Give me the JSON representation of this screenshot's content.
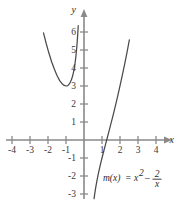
{
  "figure": {
    "kind": "cartesian-graph",
    "background_color": "#ffffff",
    "axis_color": "#8a8a8a",
    "curve_color": "#4a4a4a",
    "label_color": "#2b2b2b"
  },
  "axes": {
    "x_name": "x",
    "y_name": "y",
    "origin_px": {
      "x": 84,
      "y": 140
    },
    "unit_px": 18,
    "xlim": [
      -4.6,
      4.9
    ],
    "ylim": [
      -3.4,
      6.7
    ],
    "x_ticks": [
      "-4",
      "-3",
      "-2",
      "-1",
      "1",
      "2",
      "3",
      "4"
    ],
    "x_tick_values": [
      -4,
      -3,
      -2,
      -1,
      1,
      2,
      3,
      4
    ],
    "y_ticks": [
      "6",
      "5",
      "4",
      "3",
      "2",
      "1",
      "-1",
      "-2",
      "-3"
    ],
    "y_tick_values": [
      6,
      5,
      4,
      3,
      2,
      1,
      -1,
      -2,
      -3
    ],
    "grid": false
  },
  "equation": {
    "lhs": "m(x)",
    "equals": "=",
    "term1_base": "x",
    "term1_exp": "2",
    "minus": "–",
    "frac_num": "2",
    "frac_den": "x",
    "plain": "m(x) = x² – 2/x",
    "position_px": {
      "x": 103,
      "y": 178
    }
  },
  "chart_data": {
    "type": "line",
    "title": "",
    "xlabel": "x",
    "ylabel": "y",
    "xlim": [
      -4.6,
      4.9
    ],
    "ylim": [
      -3.4,
      6.7
    ],
    "grid": false,
    "legend": "none",
    "annotations": [
      {
        "text": "m(x) = x² – 2/x",
        "x": 1.1,
        "y": -2.1
      }
    ],
    "series": [
      {
        "name": "m(x) = x^2 - 2/x (left branch, x < 0)",
        "x": [
          -2.25,
          -2.1,
          -1.95,
          -1.8,
          -1.65,
          -1.5,
          -1.35,
          -1.2,
          -1.1,
          -1.0,
          -0.95,
          -0.9,
          -0.85,
          -0.8,
          -0.75,
          -0.7,
          -0.65,
          -0.6,
          -0.55,
          -0.5,
          -0.45,
          -0.4,
          -0.35,
          -0.32
        ],
        "y": [
          5.95,
          5.36,
          4.83,
          4.35,
          3.94,
          3.58,
          3.3,
          3.11,
          3.03,
          3.0,
          3.01,
          3.03,
          3.07,
          3.14,
          3.23,
          3.35,
          3.5,
          3.69,
          3.94,
          4.25,
          4.65,
          5.16,
          5.84,
          6.35
        ]
      },
      {
        "name": "m(x) = x^2 - 2/x (right branch, x > 0)",
        "x": [
          0.56,
          0.6,
          0.65,
          0.7,
          0.75,
          0.8,
          0.85,
          0.9,
          0.95,
          1.0,
          1.1,
          1.2,
          1.26,
          1.35,
          1.5,
          1.65,
          1.8,
          1.95,
          2.1,
          2.25,
          2.4,
          2.52
        ],
        "y": [
          -3.26,
          -2.97,
          -2.65,
          -2.37,
          -2.11,
          -1.86,
          -1.63,
          -1.41,
          -1.2,
          -1.0,
          -0.61,
          -0.23,
          0.0,
          0.34,
          0.92,
          1.51,
          2.13,
          2.78,
          3.46,
          4.17,
          4.93,
          5.56
        ]
      }
    ]
  }
}
